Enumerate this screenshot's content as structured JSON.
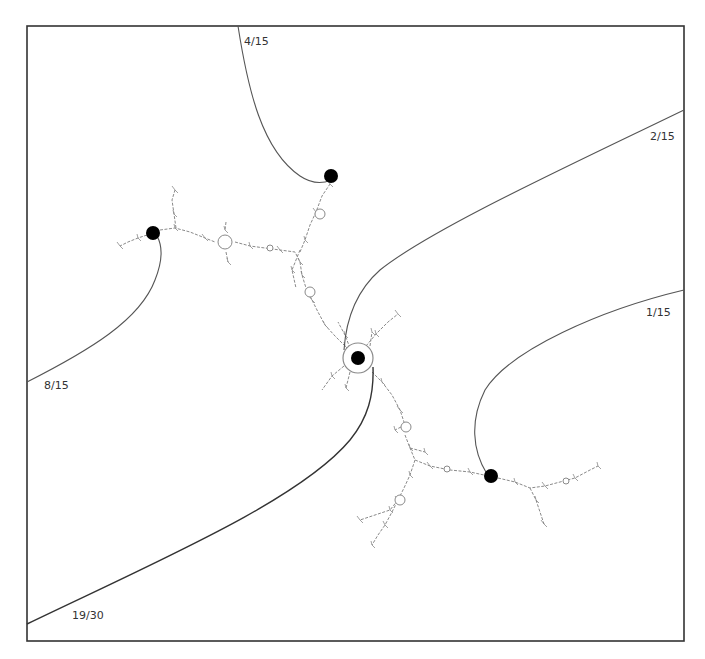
{
  "diagram": {
    "frame": {
      "x": 27,
      "y": 26,
      "width": 657,
      "height": 615,
      "stroke": "#333333"
    },
    "colors": {
      "ray": "#555555",
      "ray_dark": "#333333",
      "dot": "#000000",
      "dendrite": "#8a8a8a"
    },
    "rays": [
      {
        "id": "ray-4-15",
        "label": "4/15",
        "path": "M238,26 C248,90 262,150 300,176 C312,184 322,184 331,180",
        "label_x": 244,
        "label_y": 45
      },
      {
        "id": "ray-2-15",
        "label": "2/15",
        "path": "M684,110 C560,170 430,230 380,270 C355,292 346,320 344,350",
        "label_x": 650,
        "label_y": 140
      },
      {
        "id": "ray-8-15",
        "label": "8/15",
        "path": "M27,382 C90,350 140,320 155,280 C163,260 162,245 157,236",
        "label_x": 44,
        "label_y": 389
      },
      {
        "id": "ray-1-15",
        "label": "1/15",
        "path": "M684,290 C600,310 510,350 485,390 C470,420 472,450 487,474",
        "label_x": 646,
        "label_y": 316
      },
      {
        "id": "ray-19-30",
        "label": "19/30",
        "path": "M27,624 C160,560 300,500 350,440 C368,418 374,395 373,367",
        "label_x": 72,
        "label_y": 619,
        "dark": true
      }
    ],
    "dots": [
      {
        "id": "dot-4-15",
        "cx": 331,
        "cy": 176,
        "r": 7
      },
      {
        "id": "dot-8-15",
        "cx": 153,
        "cy": 233,
        "r": 7
      },
      {
        "id": "dot-center",
        "cx": 358,
        "cy": 358,
        "r": 7,
        "ring": 15
      },
      {
        "id": "dot-1-15",
        "cx": 491,
        "cy": 476,
        "r": 7
      }
    ],
    "dendrite_branches": [
      "M160,230 L175,228 L190,232 L205,238 L215,242",
      "M235,242 L250,246 L265,248 L280,250 L295,252 L300,262",
      "M300,252 L305,240 L310,225 L316,212 L322,196 L330,184",
      "M300,262 L302,275 L306,288 L312,300 L318,312 L325,325 L335,336 L345,346",
      "M372,372 L382,382 L392,395 L400,410 L405,425",
      "M405,435 L410,448 L415,460 L430,466 L450,470 L470,472 L484,475",
      "M498,478 L515,482 L530,488 L545,486 L560,482 L575,478 L590,470 L598,466",
      "M530,488 L536,500 L540,512 L544,524",
      "M415,460 L410,475 L404,488 L398,500 L392,512 L385,525 L378,535 L372,545",
      "M398,500 L390,510 L375,515 L360,520",
      "M176,228 L174,214 L172,200 L175,190",
      "M147,235 L138,238 L128,242 L120,246",
      "M226,222 L225,230",
      "M226,252 L228,262",
      "M350,348 L345,335 L338,322",
      "M366,346 L376,334 L388,322 L398,314",
      "M344,366 L332,376 L322,390",
      "M350,372 L346,388",
      "M370,346 L372,332",
      "M300,250 L292,270 L296,288",
      "M405,425 L395,430",
      "M410,448 L425,452"
    ],
    "dendrite_rings": [
      {
        "cx": 225,
        "cy": 242,
        "r": 7
      },
      {
        "cx": 320,
        "cy": 214,
        "r": 5
      },
      {
        "cx": 310,
        "cy": 292,
        "r": 5
      },
      {
        "cx": 406,
        "cy": 427,
        "r": 5
      },
      {
        "cx": 400,
        "cy": 500,
        "r": 5
      },
      {
        "cx": 447,
        "cy": 469,
        "r": 3
      },
      {
        "cx": 566,
        "cy": 481,
        "r": 3
      },
      {
        "cx": 270,
        "cy": 248,
        "r": 3
      }
    ]
  }
}
